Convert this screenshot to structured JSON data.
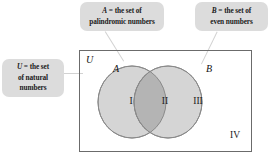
{
  "figure": {
    "type": "venn-diagram",
    "universe_label": "U",
    "callouts": [
      {
        "id": "A",
        "var": "A",
        "eq": " = the set of",
        "line2": "palindromic numbers",
        "full_text": "A = the set of palindromic numbers"
      },
      {
        "id": "B",
        "var": "B",
        "eq": " = the set of",
        "line2": "even numbers",
        "full_text": "B = the set of even numbers"
      },
      {
        "id": "U",
        "var": "U",
        "eq": " = the set",
        "line2": "of natural",
        "line3": "numbers",
        "full_text": "U = the set of natural numbers"
      }
    ],
    "set_labels": {
      "universe": "U",
      "left_circle": "A",
      "right_circle": "B"
    },
    "regions": [
      {
        "id": "I",
        "label": "I",
        "meaning": "A only"
      },
      {
        "id": "II",
        "label": "II",
        "meaning": "A intersect B"
      },
      {
        "id": "III",
        "label": "III",
        "meaning": "B only"
      },
      {
        "id": "IV",
        "label": "IV",
        "meaning": "outside A and B"
      }
    ],
    "colors": {
      "callout_bg": "#dcdcdc",
      "circle_fill": "#d5d5d5",
      "intersection_fill": "#b4b4b4",
      "circle_stroke": "#8a8a8a",
      "box_stroke": "#6b6b6b",
      "leader_line": "#d2d2d2",
      "text": "#1a1a1a",
      "page_bg": "#ffffff"
    }
  }
}
